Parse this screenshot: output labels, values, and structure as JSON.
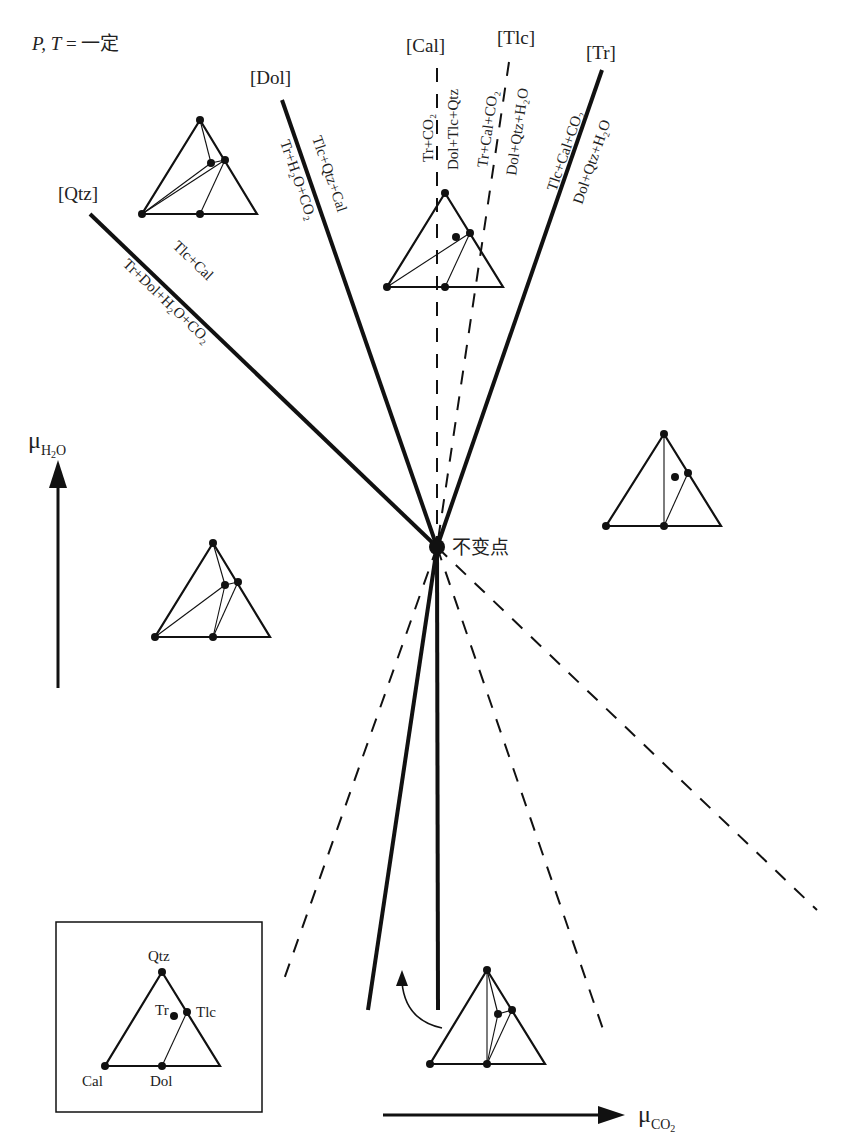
{
  "condition": {
    "prefix": "P, T",
    "eq": " = ",
    "value": "一定"
  },
  "invariant_point": {
    "label": "不变点"
  },
  "axes": {
    "y": {
      "symbol": "μ",
      "subscript": "H",
      "sub2": "2",
      "sub3": "O"
    },
    "x": {
      "symbol": "μ",
      "subscript": "CO",
      "sub2": "2"
    }
  },
  "reactions": [
    {
      "id": "Qtz",
      "label": "[Qtz]",
      "top": "Tlc+Cal",
      "bottom": "Tr+Dol+H₂O+CO₂",
      "style": "solid"
    },
    {
      "id": "Dol",
      "label": "[Dol]",
      "top": "Tlc+Qtz+Cal",
      "bottom": "Tr+H₂O+CO₂",
      "style": "solid"
    },
    {
      "id": "Cal",
      "label": "[Cal]",
      "top": "Tr+CO₂",
      "bottom": "Dol+Tlc+Qtz",
      "style": "dashed"
    },
    {
      "id": "Tlc",
      "label": "[Tlc]",
      "top": "Tr+Cal+CO₂",
      "bottom": "Dol+Qtz+H₂O",
      "style": "dashed"
    },
    {
      "id": "Tr",
      "label": "[Tr]",
      "top": "Tlc+Cal+CO₂",
      "bottom": "Dol+Qtz+H₂O",
      "style": "solid"
    }
  ],
  "legend": {
    "phases": [
      "Qtz",
      "Tr",
      "Tlc",
      "Cal",
      "Dol"
    ]
  }
}
